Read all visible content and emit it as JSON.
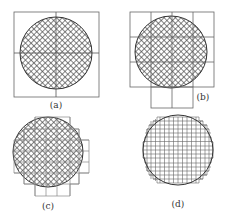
{
  "figure": {
    "panels": [
      {
        "id": "a",
        "label": "(a)",
        "description": "Circle inside a single square divided by a central cross",
        "grid": "1x1 square with center cross"
      },
      {
        "id": "b",
        "label": "(b)",
        "description": "Circle over a 4x3 coarse grid with two extra cells below",
        "grid": "4 columns x 3 rows + 2 cells"
      },
      {
        "id": "c",
        "label": "(c)",
        "description": "Circle covered by a stepped medium-resolution grid",
        "grid": "~8x8 stepped"
      },
      {
        "id": "d",
        "label": "(d)",
        "description": "Circle approximated by a fine stepped grid (no hatch fill)",
        "grid": "~16x16 stepped"
      }
    ],
    "colors": {
      "line": "#555555",
      "hatch": "#444444",
      "background": "#ffffff"
    }
  }
}
